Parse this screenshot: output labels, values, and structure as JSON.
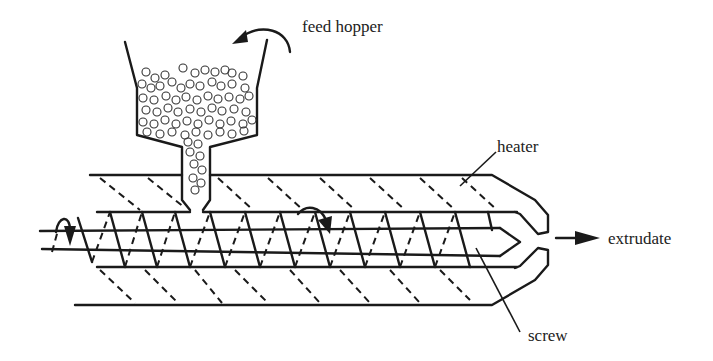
{
  "diagram": {
    "labels": {
      "feed_hopper": "feed hopper",
      "heater": "heater",
      "extrudate": "extrudate",
      "screw": "screw"
    },
    "colors": {
      "line": "#1a1a1a",
      "text": "#222222",
      "background": "#ffffff"
    }
  }
}
